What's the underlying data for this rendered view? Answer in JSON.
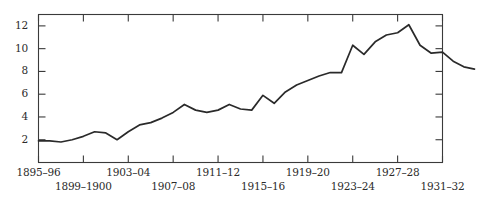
{
  "chart_data": {
    "type": "line",
    "title": "",
    "xlabel": "",
    "ylabel": "",
    "grid": false,
    "legend": null,
    "xlim": [
      1895,
      1931
    ],
    "ylim": [
      0,
      13
    ],
    "yticks": [
      2,
      4,
      6,
      8,
      10,
      12
    ],
    "ytick_labels": [
      "2",
      "4",
      "6",
      "8",
      "10",
      "12"
    ],
    "xtick_labels": [
      "1895–96",
      "1899–1900",
      "1903–04",
      "1907–08",
      "1911–12",
      "1915–16",
      "1919–20",
      "1923–24",
      "1927–28",
      "1931–32"
    ],
    "xtick_values": [
      1895,
      1899,
      1903,
      1907,
      1911,
      1915,
      1919,
      1923,
      1927,
      1931
    ],
    "xtick_rows": [
      0,
      1,
      0,
      1,
      0,
      1,
      0,
      1,
      0,
      1
    ],
    "x": [
      1895,
      1896,
      1897,
      1898,
      1899,
      1900,
      1901,
      1902,
      1903,
      1904,
      1905,
      1906,
      1907,
      1908,
      1909,
      1910,
      1911,
      1912,
      1913,
      1914,
      1915,
      1916,
      1917,
      1918,
      1919,
      1920,
      1921,
      1922,
      1923,
      1924,
      1925,
      1926,
      1927,
      1928,
      1929,
      1930,
      1931
    ],
    "values": [
      1.9,
      1.9,
      1.8,
      2.0,
      2.3,
      2.7,
      2.6,
      2.0,
      2.7,
      3.3,
      3.5,
      3.9,
      4.4,
      5.1,
      4.6,
      4.4,
      4.6,
      5.1,
      4.7,
      4.6,
      5.9,
      5.2,
      6.2,
      6.8,
      7.2,
      7.6,
      7.9,
      7.9,
      10.3,
      9.5,
      10.6,
      11.2,
      11.4,
      12.1,
      10.3,
      9.6,
      9.7
    ],
    "line_color": "#2a2a2a",
    "axis_color": "#3a3a3a",
    "series_name": ""
  },
  "chart_tail": {
    "note": "",
    "final_values": [
      8.9,
      8.4,
      8.2
    ]
  }
}
